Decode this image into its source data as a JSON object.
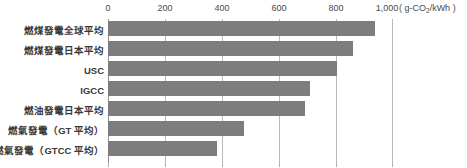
{
  "chart_data": {
    "type": "bar",
    "orientation": "horizontal",
    "title": "",
    "subtitle": "",
    "xlabel": "( g-CO₂/kWh )",
    "ylabel": "",
    "unit_prefix": "( g-CO",
    "unit_sub": "2",
    "unit_suffix": "/kWh )",
    "categories": [
      "燃煤發電全球平均",
      "燃煤發電日本平均",
      "USC",
      "IGCC",
      "燃油發電日本平均",
      "燃氣發電（GT 平均）",
      "燃氣發電（GTCC 平均）"
    ],
    "values": [
      940,
      864,
      806,
      711,
      695,
      479,
      384
    ],
    "xlim": [
      0,
      1000
    ],
    "xticks": [
      0,
      200,
      400,
      600,
      800,
      1000
    ],
    "xtick_labels": [
      "0",
      "200",
      "400",
      "600",
      "800",
      "1,000"
    ],
    "grid": true,
    "legend": false,
    "bar_color": "#7d7d7d",
    "gridline_color": "#b9b9b9",
    "axis_color": "#8e8e8e",
    "background_color": "#ffffff",
    "text_color": "#3a3a3a"
  }
}
